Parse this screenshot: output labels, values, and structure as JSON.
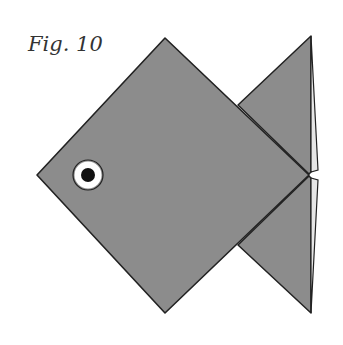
{
  "figure": {
    "caption": "Fig. 10",
    "colors": {
      "paper_fill": "#8c8c8c",
      "outline": "#222222",
      "tail_edge_fill": "#e6e6e6",
      "eye_ring": "#ffffff",
      "pupil": "#111111",
      "background": "#ffffff"
    },
    "icons": [
      "eye-icon"
    ]
  }
}
